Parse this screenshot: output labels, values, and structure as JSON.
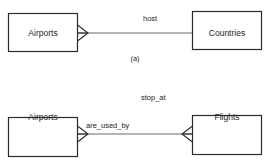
{
  "figure": {
    "clipped_header_text": "",
    "width": 270,
    "height": 162,
    "stroke_color": "#2b2b2b",
    "text_color": "#1c1c1c",
    "background_color": "#ffffff"
  },
  "diagrams": [
    {
      "id": "a",
      "caption": "(a)",
      "entities": [
        {
          "name": "Airports",
          "side": "left"
        },
        {
          "name": "Countries",
          "side": "right"
        }
      ],
      "relationship": {
        "labels": [
          {
            "text": "host",
            "position": "above-right"
          }
        ],
        "left_cardinality": "many",
        "right_cardinality": "one"
      }
    },
    {
      "id": "b",
      "caption": "",
      "entities": [
        {
          "name": "Airports",
          "side": "left"
        },
        {
          "name": "Flights",
          "side": "right"
        }
      ],
      "relationship": {
        "labels": [
          {
            "text": "stop_at",
            "position": "above-right"
          },
          {
            "text": "are_used_by",
            "position": "below-left"
          }
        ],
        "left_cardinality": "many",
        "right_cardinality": "many"
      }
    }
  ]
}
